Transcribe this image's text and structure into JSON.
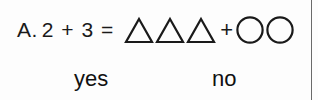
{
  "worksheet": {
    "problem": {
      "label": "A.",
      "equation": "2 + 3 =",
      "operand_left": "2",
      "operator": "+",
      "operand_right": "3",
      "equals": "=",
      "shape_expression": {
        "left_group": {
          "shape": "triangle",
          "count": 3
        },
        "operator": "+",
        "right_group": {
          "shape": "circle",
          "count": 2
        }
      }
    },
    "options": [
      {
        "id": "yes",
        "label": "yes"
      },
      {
        "id": "no",
        "label": "no"
      }
    ],
    "colors": {
      "ink": "#1a1a1a",
      "background": "#fdfdfd",
      "rule": "#6b6b6b"
    }
  }
}
